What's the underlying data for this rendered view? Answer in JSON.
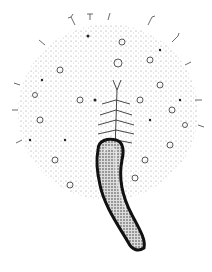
{
  "image": {
    "subject": "stippled scientific illustration of a radial organism with central stalk",
    "background": "#ffffff",
    "ink": "#1a1a1a",
    "width": 212,
    "height": 272
  }
}
